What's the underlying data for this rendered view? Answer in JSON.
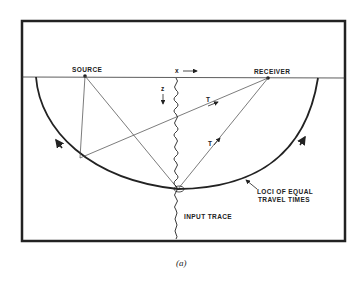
{
  "figure": {
    "caption": "(a)",
    "labels": {
      "source": "SOURCE",
      "receiver": "RECEIVER",
      "x_axis": "x",
      "z_axis": "z",
      "ray_t1": "T",
      "ray_t2": "T",
      "loci_line1": "LOCI OF EQUAL",
      "loci_line2": "TRAVEL TIMES",
      "input_trace": "INPUT TRACE"
    },
    "colors": {
      "ink": "#222222",
      "background": "#ffffff"
    }
  }
}
